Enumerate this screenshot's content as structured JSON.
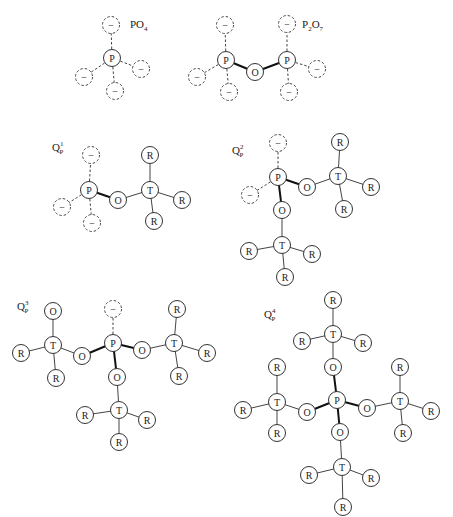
{
  "diagram": {
    "node_radius": 8.5,
    "structures": [
      {
        "id": "PO4",
        "label": {
          "main": "PO",
          "sub": "4",
          "sup": "",
          "x": 130,
          "y": 28
        },
        "nodes": [
          {
            "id": "P",
            "text": "P",
            "x": 112,
            "y": 58,
            "dashed": false
          },
          {
            "id": "m1",
            "text": "−",
            "x": 111,
            "y": 25,
            "dashed": true
          },
          {
            "id": "m2",
            "text": "−",
            "x": 84,
            "y": 77,
            "dashed": true
          },
          {
            "id": "m3",
            "text": "−",
            "x": 141,
            "y": 69,
            "dashed": true
          },
          {
            "id": "m4",
            "text": "−",
            "x": 115,
            "y": 91,
            "dashed": true
          }
        ],
        "bonds": [
          {
            "a": "P",
            "b": "m1",
            "style": "dashed"
          },
          {
            "a": "P",
            "b": "m2",
            "style": "dashed"
          },
          {
            "a": "P",
            "b": "m3",
            "style": "dashed"
          },
          {
            "a": "P",
            "b": "m4",
            "style": "dashed"
          }
        ]
      },
      {
        "id": "P2O7",
        "label": {
          "main": "P",
          "sub": "2",
          "main2": "O",
          "sub2": "7",
          "x": 302,
          "y": 28
        },
        "nodes": [
          {
            "id": "P1",
            "text": "P",
            "x": 226,
            "y": 60,
            "dashed": false
          },
          {
            "id": "O",
            "text": "O",
            "x": 255,
            "y": 72,
            "dashed": false
          },
          {
            "id": "P2",
            "text": "P",
            "x": 287,
            "y": 60,
            "dashed": false
          },
          {
            "id": "m1",
            "text": "−",
            "x": 225,
            "y": 25,
            "dashed": true
          },
          {
            "id": "m2",
            "text": "−",
            "x": 197,
            "y": 77,
            "dashed": true
          },
          {
            "id": "m3",
            "text": "−",
            "x": 229,
            "y": 92,
            "dashed": true
          },
          {
            "id": "m4",
            "text": "−",
            "x": 287,
            "y": 24,
            "dashed": true
          },
          {
            "id": "m5",
            "text": "−",
            "x": 317,
            "y": 69,
            "dashed": true
          },
          {
            "id": "m6",
            "text": "−",
            "x": 289,
            "y": 92,
            "dashed": true
          }
        ],
        "bonds": [
          {
            "a": "P1",
            "b": "O",
            "style": "bold"
          },
          {
            "a": "O",
            "b": "P2",
            "style": "bold"
          },
          {
            "a": "P1",
            "b": "m1",
            "style": "dashed"
          },
          {
            "a": "P1",
            "b": "m2",
            "style": "dashed"
          },
          {
            "a": "P1",
            "b": "m3",
            "style": "dashed"
          },
          {
            "a": "P2",
            "b": "m4",
            "style": "dashed"
          },
          {
            "a": "P2",
            "b": "m5",
            "style": "dashed"
          },
          {
            "a": "P2",
            "b": "m6",
            "style": "dashed"
          }
        ]
      },
      {
        "id": "Q1P",
        "label": {
          "main": "Q",
          "sub": "P",
          "sup": "1",
          "x": 52,
          "y": 151
        },
        "nodes": [
          {
            "id": "P",
            "text": "P",
            "x": 89,
            "y": 190,
            "dashed": false
          },
          {
            "id": "m1",
            "text": "−",
            "x": 91,
            "y": 155,
            "dashed": true
          },
          {
            "id": "m2",
            "text": "−",
            "x": 62,
            "y": 207,
            "dashed": true
          },
          {
            "id": "m3",
            "text": "−",
            "x": 92,
            "y": 223,
            "dashed": true
          },
          {
            "id": "O",
            "text": "O",
            "x": 118,
            "y": 200,
            "dashed": false
          },
          {
            "id": "T",
            "text": "T",
            "x": 150,
            "y": 190,
            "dashed": false
          },
          {
            "id": "R1",
            "text": "R",
            "x": 150,
            "y": 155,
            "dashed": false
          },
          {
            "id": "R2",
            "text": "R",
            "x": 182,
            "y": 200,
            "dashed": false
          },
          {
            "id": "R3",
            "text": "R",
            "x": 154,
            "y": 221,
            "dashed": false
          }
        ],
        "bonds": [
          {
            "a": "P",
            "b": "m1",
            "style": "dashed"
          },
          {
            "a": "P",
            "b": "m2",
            "style": "dashed"
          },
          {
            "a": "P",
            "b": "m3",
            "style": "dashed"
          },
          {
            "a": "P",
            "b": "O",
            "style": "bold"
          },
          {
            "a": "O",
            "b": "T",
            "style": "solid"
          },
          {
            "a": "T",
            "b": "R1",
            "style": "solid"
          },
          {
            "a": "T",
            "b": "R2",
            "style": "solid"
          },
          {
            "a": "T",
            "b": "R3",
            "style": "solid"
          }
        ]
      },
      {
        "id": "Q2P",
        "label": {
          "main": "Q",
          "sub": "P",
          "sup": "2",
          "x": 232,
          "y": 154
        },
        "nodes": [
          {
            "id": "P",
            "text": "P",
            "x": 278,
            "y": 177,
            "dashed": false
          },
          {
            "id": "m1",
            "text": "−",
            "x": 278,
            "y": 143,
            "dashed": true
          },
          {
            "id": "m2",
            "text": "−",
            "x": 250,
            "y": 195,
            "dashed": true
          },
          {
            "id": "O1",
            "text": "O",
            "x": 307,
            "y": 187,
            "dashed": false
          },
          {
            "id": "T1",
            "text": "T",
            "x": 338,
            "y": 176,
            "dashed": false
          },
          {
            "id": "R1",
            "text": "R",
            "x": 340,
            "y": 142,
            "dashed": false
          },
          {
            "id": "R2",
            "text": "R",
            "x": 371,
            "y": 187,
            "dashed": false
          },
          {
            "id": "R3",
            "text": "R",
            "x": 344,
            "y": 209,
            "dashed": false
          },
          {
            "id": "O2",
            "text": "O",
            "x": 282,
            "y": 210,
            "dashed": false
          },
          {
            "id": "T2",
            "text": "T",
            "x": 282,
            "y": 245,
            "dashed": false
          },
          {
            "id": "R4",
            "text": "R",
            "x": 249,
            "y": 251,
            "dashed": false
          },
          {
            "id": "R5",
            "text": "R",
            "x": 312,
            "y": 254,
            "dashed": false
          },
          {
            "id": "R6",
            "text": "R",
            "x": 285,
            "y": 277,
            "dashed": false
          }
        ],
        "bonds": [
          {
            "a": "P",
            "b": "m1",
            "style": "dashed"
          },
          {
            "a": "P",
            "b": "m2",
            "style": "dashed"
          },
          {
            "a": "P",
            "b": "O1",
            "style": "bold"
          },
          {
            "a": "P",
            "b": "O2",
            "style": "bold"
          },
          {
            "a": "O1",
            "b": "T1",
            "style": "solid"
          },
          {
            "a": "T1",
            "b": "R1",
            "style": "solid"
          },
          {
            "a": "T1",
            "b": "R2",
            "style": "solid"
          },
          {
            "a": "T1",
            "b": "R3",
            "style": "solid"
          },
          {
            "a": "O2",
            "b": "T2",
            "style": "solid"
          },
          {
            "a": "T2",
            "b": "R4",
            "style": "solid"
          },
          {
            "a": "T2",
            "b": "R5",
            "style": "solid"
          },
          {
            "a": "T2",
            "b": "R6",
            "style": "solid"
          }
        ]
      },
      {
        "id": "Q3P",
        "label": {
          "main": "Q",
          "sub": "P",
          "sup": "3",
          "x": 17,
          "y": 310
        },
        "nodes": [
          {
            "id": "P",
            "text": "P",
            "x": 113,
            "y": 343,
            "dashed": false
          },
          {
            "id": "m1",
            "text": "−",
            "x": 113,
            "y": 309,
            "dashed": true
          },
          {
            "id": "O1",
            "text": "O",
            "x": 82,
            "y": 356,
            "dashed": false
          },
          {
            "id": "T1",
            "text": "T",
            "x": 53,
            "y": 345,
            "dashed": false
          },
          {
            "id": "O1t",
            "text": "O",
            "x": 53,
            "y": 311,
            "dashed": false
          },
          {
            "id": "R1",
            "text": "R",
            "x": 21,
            "y": 353,
            "dashed": false
          },
          {
            "id": "R2",
            "text": "R",
            "x": 56,
            "y": 378,
            "dashed": false
          },
          {
            "id": "O2",
            "text": "O",
            "x": 142,
            "y": 350,
            "dashed": false
          },
          {
            "id": "T2",
            "text": "T",
            "x": 174,
            "y": 343,
            "dashed": false
          },
          {
            "id": "R3",
            "text": "R",
            "x": 177,
            "y": 309,
            "dashed": false
          },
          {
            "id": "R4",
            "text": "R",
            "x": 207,
            "y": 353,
            "dashed": false
          },
          {
            "id": "R5",
            "text": "R",
            "x": 179,
            "y": 376,
            "dashed": false
          },
          {
            "id": "O3",
            "text": "O",
            "x": 117,
            "y": 377,
            "dashed": false
          },
          {
            "id": "T3",
            "text": "T",
            "x": 119,
            "y": 410,
            "dashed": false
          },
          {
            "id": "R6",
            "text": "R",
            "x": 85,
            "y": 415,
            "dashed": false
          },
          {
            "id": "R7",
            "text": "R",
            "x": 147,
            "y": 420,
            "dashed": false
          },
          {
            "id": "R8",
            "text": "R",
            "x": 119,
            "y": 442,
            "dashed": false
          }
        ],
        "bonds": [
          {
            "a": "P",
            "b": "m1",
            "style": "dashed"
          },
          {
            "a": "P",
            "b": "O1",
            "style": "bold"
          },
          {
            "a": "P",
            "b": "O2",
            "style": "bold"
          },
          {
            "a": "P",
            "b": "O3",
            "style": "bold"
          },
          {
            "a": "O1",
            "b": "T1",
            "style": "solid"
          },
          {
            "a": "T1",
            "b": "O1t",
            "style": "solid"
          },
          {
            "a": "T1",
            "b": "R1",
            "style": "solid"
          },
          {
            "a": "T1",
            "b": "R2",
            "style": "solid"
          },
          {
            "a": "O2",
            "b": "T2",
            "style": "solid"
          },
          {
            "a": "T2",
            "b": "R3",
            "style": "solid"
          },
          {
            "a": "T2",
            "b": "R4",
            "style": "solid"
          },
          {
            "a": "T2",
            "b": "R5",
            "style": "solid"
          },
          {
            "a": "O3",
            "b": "T3",
            "style": "solid"
          },
          {
            "a": "T3",
            "b": "R6",
            "style": "solid"
          },
          {
            "a": "T3",
            "b": "R7",
            "style": "solid"
          },
          {
            "a": "T3",
            "b": "R8",
            "style": "solid"
          }
        ]
      },
      {
        "id": "Q4P",
        "label": {
          "main": "Q",
          "sub": "P",
          "sup": "4",
          "x": 264,
          "y": 318
        },
        "nodes": [
          {
            "id": "P",
            "text": "P",
            "x": 337,
            "y": 400,
            "dashed": false
          },
          {
            "id": "O1",
            "text": "O",
            "x": 333,
            "y": 367,
            "dashed": false
          },
          {
            "id": "T1",
            "text": "T",
            "x": 333,
            "y": 334,
            "dashed": false
          },
          {
            "id": "R1",
            "text": "R",
            "x": 333,
            "y": 300,
            "dashed": false
          },
          {
            "id": "R2",
            "text": "R",
            "x": 302,
            "y": 341,
            "dashed": false
          },
          {
            "id": "R3",
            "text": "R",
            "x": 363,
            "y": 343,
            "dashed": false
          },
          {
            "id": "O2",
            "text": "O",
            "x": 307,
            "y": 412,
            "dashed": false
          },
          {
            "id": "T2",
            "text": "T",
            "x": 277,
            "y": 402,
            "dashed": false
          },
          {
            "id": "R4",
            "text": "R",
            "x": 277,
            "y": 367,
            "dashed": false
          },
          {
            "id": "R5",
            "text": "R",
            "x": 243,
            "y": 410,
            "dashed": false
          },
          {
            "id": "R6",
            "text": "R",
            "x": 277,
            "y": 433,
            "dashed": false
          },
          {
            "id": "O3",
            "text": "O",
            "x": 367,
            "y": 408,
            "dashed": false
          },
          {
            "id": "T3",
            "text": "T",
            "x": 400,
            "y": 401,
            "dashed": false
          },
          {
            "id": "R7",
            "text": "R",
            "x": 400,
            "y": 367,
            "dashed": false
          },
          {
            "id": "R8",
            "text": "R",
            "x": 431,
            "y": 411,
            "dashed": false
          },
          {
            "id": "R9",
            "text": "R",
            "x": 403,
            "y": 433,
            "dashed": false
          },
          {
            "id": "O4",
            "text": "O",
            "x": 340,
            "y": 432,
            "dashed": false
          },
          {
            "id": "T4",
            "text": "T",
            "x": 342,
            "y": 467,
            "dashed": false
          },
          {
            "id": "R10",
            "text": "R",
            "x": 309,
            "y": 475,
            "dashed": false
          },
          {
            "id": "R11",
            "text": "R",
            "x": 371,
            "y": 478,
            "dashed": false
          },
          {
            "id": "R12",
            "text": "R",
            "x": 343,
            "y": 507,
            "dashed": false
          }
        ],
        "bonds": [
          {
            "a": "P",
            "b": "O1",
            "style": "bold"
          },
          {
            "a": "P",
            "b": "O2",
            "style": "bold"
          },
          {
            "a": "P",
            "b": "O3",
            "style": "bold"
          },
          {
            "a": "P",
            "b": "O4",
            "style": "bold"
          },
          {
            "a": "O1",
            "b": "T1",
            "style": "solid"
          },
          {
            "a": "T1",
            "b": "R1",
            "style": "solid"
          },
          {
            "a": "T1",
            "b": "R2",
            "style": "solid"
          },
          {
            "a": "T1",
            "b": "R3",
            "style": "solid"
          },
          {
            "a": "O2",
            "b": "T2",
            "style": "solid"
          },
          {
            "a": "T2",
            "b": "R4",
            "style": "solid"
          },
          {
            "a": "T2",
            "b": "R5",
            "style": "solid"
          },
          {
            "a": "T2",
            "b": "R6",
            "style": "solid"
          },
          {
            "a": "O3",
            "b": "T3",
            "style": "solid"
          },
          {
            "a": "T3",
            "b": "R7",
            "style": "solid"
          },
          {
            "a": "T3",
            "b": "R8",
            "style": "solid"
          },
          {
            "a": "T3",
            "b": "R9",
            "style": "solid"
          },
          {
            "a": "O4",
            "b": "T4",
            "style": "solid"
          },
          {
            "a": "T4",
            "b": "R10",
            "style": "solid"
          },
          {
            "a": "T4",
            "b": "R11",
            "style": "solid"
          },
          {
            "a": "T4",
            "b": "R12",
            "style": "solid"
          }
        ]
      }
    ]
  }
}
